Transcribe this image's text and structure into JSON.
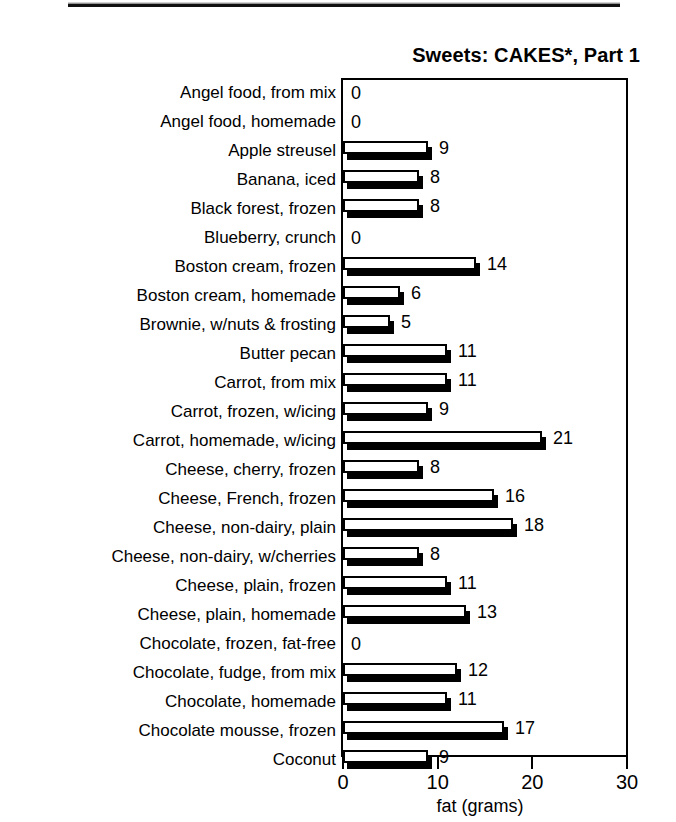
{
  "page": {
    "top_rule_present": true
  },
  "chart_data": {
    "type": "bar",
    "orientation": "horizontal",
    "title": "Sweets: CAKES*, Part 1",
    "xlabel": "fat (grams)",
    "ylabel": "",
    "xlim": [
      0,
      30
    ],
    "xticks": [
      0,
      10,
      20,
      30
    ],
    "xtick_labels": [
      "0",
      "10",
      "20",
      "30"
    ],
    "grid": false,
    "legend": null,
    "data_labels": true,
    "categories": [
      "Angel food, from mix",
      "Angel food, homemade",
      "Apple streusel",
      "Banana, iced",
      "Black forest, frozen",
      "Blueberry, crunch",
      "Boston cream, frozen",
      "Boston cream, homemade",
      "Brownie, w/nuts & frosting",
      "Butter pecan",
      "Carrot, from mix",
      "Carrot, frozen, w/icing",
      "Carrot, homemade, w/icing",
      "Cheese, cherry, frozen",
      "Cheese, French, frozen",
      "Cheese, non-dairy, plain",
      "Cheese, non-dairy, w/cherries",
      "Cheese, plain, frozen",
      "Cheese, plain, homemade",
      "Chocolate, frozen, fat-free",
      "Chocolate, fudge, from mix",
      "Chocolate, homemade",
      "Chocolate mousse, frozen",
      "Coconut"
    ],
    "values": [
      0,
      0,
      9,
      8,
      8,
      0,
      14,
      6,
      5,
      11,
      11,
      9,
      21,
      8,
      16,
      18,
      8,
      11,
      13,
      0,
      12,
      11,
      17,
      9
    ],
    "value_labels": [
      "0",
      "0",
      "9",
      "8",
      "8",
      "0",
      "14",
      "6",
      "5",
      "11",
      "11",
      "9",
      "21",
      "8",
      "16",
      "18",
      "8",
      "11",
      "13",
      "0",
      "12",
      "11",
      "17",
      "9"
    ]
  }
}
